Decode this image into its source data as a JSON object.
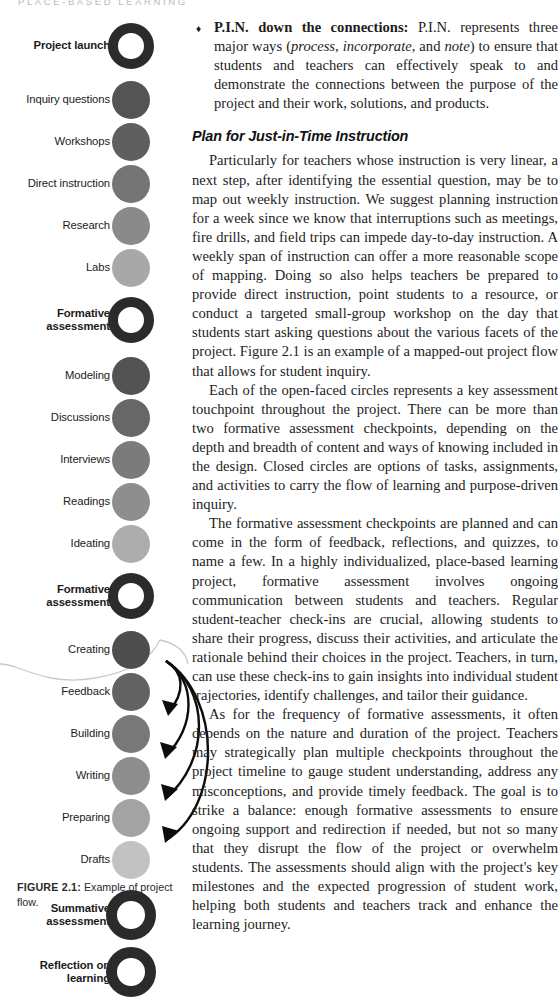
{
  "page": {
    "running_head": "PLACE-BASED LEARNING",
    "width": 558,
    "height": 937,
    "background": "#ffffff",
    "text_color": "#1d1d1d"
  },
  "figure": {
    "caption_label": "FIGURE 2.1:",
    "caption_text": " Example of project flow.",
    "nodes": [
      {
        "label": "Project launch",
        "style": "open",
        "bold": true,
        "color": "#2b2b2b",
        "size": 46,
        "cy": 46
      },
      {
        "label": "Inquiry questions",
        "style": "filled",
        "bold": false,
        "color": "#545454",
        "size": 38,
        "cy": 100
      },
      {
        "label": "Workshops",
        "style": "filled",
        "bold": false,
        "color": "#5f5f5f",
        "size": 38,
        "cy": 142
      },
      {
        "label": "Direct instruction",
        "style": "filled",
        "bold": false,
        "color": "#757575",
        "size": 38,
        "cy": 184
      },
      {
        "label": "Research",
        "style": "filled",
        "bold": false,
        "color": "#8a8a8a",
        "size": 38,
        "cy": 226
      },
      {
        "label": "Labs",
        "style": "filled",
        "bold": false,
        "color": "#a8a8a8",
        "size": 38,
        "cy": 268
      },
      {
        "label": "Formative\nassessment",
        "style": "open",
        "bold": true,
        "color": "#2b2b2b",
        "size": 46,
        "cy": 320
      },
      {
        "label": "Modeling",
        "style": "filled",
        "bold": false,
        "color": "#535353",
        "size": 38,
        "cy": 376
      },
      {
        "label": "Discussions",
        "style": "filled",
        "bold": false,
        "color": "#676767",
        "size": 38,
        "cy": 418
      },
      {
        "label": "Interviews",
        "style": "filled",
        "bold": false,
        "color": "#7b7b7b",
        "size": 38,
        "cy": 460
      },
      {
        "label": "Readings",
        "style": "filled",
        "bold": false,
        "color": "#8e8e8e",
        "size": 38,
        "cy": 502
      },
      {
        "label": "Ideating",
        "style": "filled",
        "bold": false,
        "color": "#adadad",
        "size": 38,
        "cy": 544
      },
      {
        "label": "Formative\nassessment",
        "style": "open",
        "bold": true,
        "color": "#2b2b2b",
        "size": 46,
        "cy": 596
      },
      {
        "label": "Creating",
        "style": "filled",
        "bold": false,
        "color": "#4e4e4e",
        "size": 38,
        "cy": 650
      },
      {
        "label": "Feedback",
        "style": "filled",
        "bold": false,
        "color": "#626262",
        "size": 38,
        "cy": 692
      },
      {
        "label": "Building",
        "style": "filled",
        "bold": false,
        "color": "#787878",
        "size": 38,
        "cy": 734
      },
      {
        "label": "Writing",
        "style": "filled",
        "bold": false,
        "color": "#8d8d8d",
        "size": 38,
        "cy": 776
      },
      {
        "label": "Preparing",
        "style": "filled",
        "bold": false,
        "color": "#a3a3a3",
        "size": 38,
        "cy": 818
      },
      {
        "label": "Drafts",
        "style": "filled",
        "bold": false,
        "color": "#c2c2c2",
        "size": 38,
        "cy": 860
      },
      {
        "label": "Summative\nassessment",
        "style": "open",
        "bold": true,
        "color": "#2b2b2b",
        "size": 50,
        "cy": 915
      },
      {
        "label": "Reflection on\nlearning",
        "style": "open",
        "bold": true,
        "color": "#2b2b2b",
        "size": 50,
        "cy": 972
      }
    ],
    "arrow_color": "#0d0d0d",
    "soft_curve_color": "#c9c9c9"
  },
  "body": {
    "bullet": {
      "glyph": "♦",
      "run_in": "P.I.N. down the connections:",
      "text_before_italics": " P.I.N. represents three major ways (",
      "italic_1": "process",
      "mid_1": ", ",
      "italic_2": "incorporate",
      "mid_2": ", and ",
      "italic_3": "note",
      "text_after": ") to ensure that students and teachers can effectively speak to and demonstrate the connections between the purpose of the project and their work, solutions, and products."
    },
    "section_heading": "Plan for Just-in-Time Instruction",
    "paragraphs": [
      "Particularly for teachers whose instruction is very linear, a next step, after identifying the essential question, may be to map out weekly instruction. We suggest planning instruction for a week since we know that interruptions such as meetings, fire drills, and field trips can impede day-to-day instruction. A weekly span of instruction can offer a more reasonable scope of mapping. Doing so also helps teachers be prepared to provide direct instruction, point students to a resource, or conduct a targeted small-group workshop on the day that students start asking questions about the various facets of the project. Figure 2.1 is an example of a mapped-out project flow that allows for student inquiry.",
      "Each of the open-faced circles represents a key assessment touchpoint throughout the project. There can be more than two formative assessment checkpoints, depending on the depth and breadth of content and ways of knowing included in the design. Closed circles are options of tasks, assignments, and activities to carry the flow of learning and purpose-driven inquiry.",
      "The formative assessment checkpoints are planned and can come in the form of feedback, reflections, and quizzes, to name a few. In a highly individualized, place-based learning project, formative assessment involves ongoing communication between students and teachers. Regular student-teacher check-ins are crucial, allowing students to share their progress, discuss their activities, and articulate the rationale behind their choices in the project. Teachers, in turn, can use these check-ins to gain insights into individual student trajectories, identify challenges, and tailor their guidance.",
      "As for the frequency of formative assessments, it often depends on the nature and duration of the project. Teachers may strategically plan multiple checkpoints throughout the project timeline to gauge student understanding, address any misconceptions, and provide timely feedback. The goal is to strike a balance: enough formative assessments to ensure ongoing support and redirection if needed, but not so many that they disrupt the flow of the project or overwhelm students. The assessments should align with the project's key milestones and the expected progression of student work, helping both students and teachers track and enhance the learning journey."
    ]
  }
}
